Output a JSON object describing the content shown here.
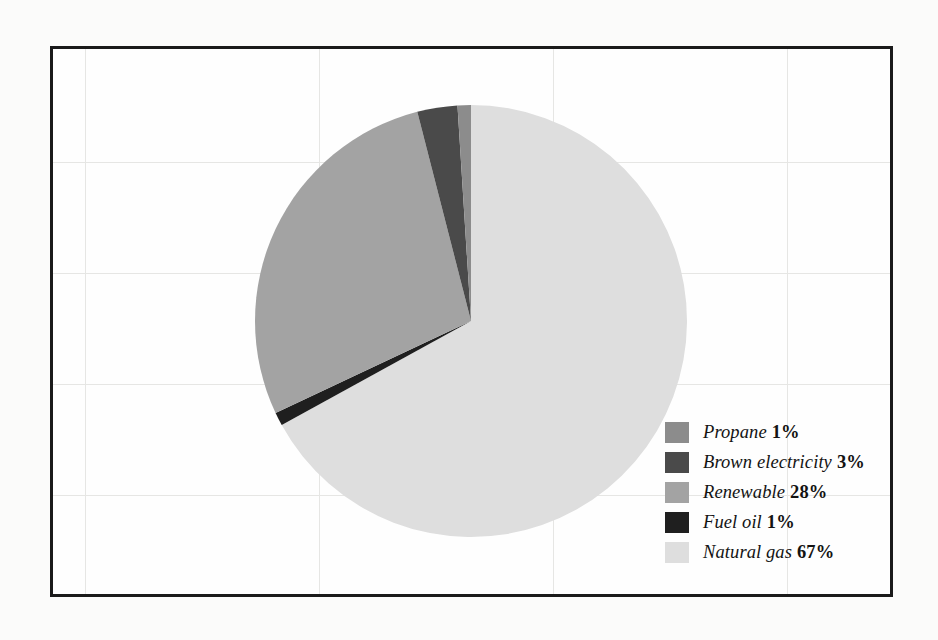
{
  "figure": {
    "background_color": "#fbfbfa",
    "frame_color": "#1a1a1a",
    "grid_color": "#e6e6e4"
  },
  "chart_data": {
    "type": "pie",
    "title": "",
    "subtitle": "",
    "xlabel": "",
    "ylabel": "",
    "grid": true,
    "legend_position": "lower-right",
    "unit": "%",
    "start_angle_deg": 0,
    "direction": "clockwise",
    "categories": [
      "Natural gas",
      "Fuel oil",
      "Renewable",
      "Brown electricity",
      "Propane"
    ],
    "values": [
      67,
      1,
      28,
      3,
      1
    ],
    "colors": [
      "#dedede",
      "#1f1f1f",
      "#a3a3a3",
      "#4a4a4a",
      "#8c8c8c"
    ],
    "series": [
      {
        "name": "Energy mix",
        "values": [
          67,
          1,
          28,
          3,
          1
        ]
      }
    ],
    "slices": [
      {
        "label": "Natural gas",
        "value": 67,
        "display": "67%",
        "color": "#dedede"
      },
      {
        "label": "Fuel oil",
        "value": 1,
        "display": "1%",
        "color": "#1f1f1f"
      },
      {
        "label": "Renewable",
        "value": 28,
        "display": "28%",
        "color": "#a3a3a3"
      },
      {
        "label": "Brown electricity",
        "value": 3,
        "display": "3%",
        "color": "#4a4a4a"
      },
      {
        "label": "Propane",
        "value": 1,
        "display": "1%",
        "color": "#8c8c8c"
      }
    ]
  },
  "legend": {
    "entries": [
      {
        "label": "Propane",
        "percent": "1%",
        "color": "#8c8c8c"
      },
      {
        "label": "Brown electricity",
        "percent": "3%",
        "color": "#4a4a4a"
      },
      {
        "label": "Renewable",
        "percent": "28%",
        "color": "#a3a3a3"
      },
      {
        "label": "Fuel oil",
        "percent": "1%",
        "color": "#1f1f1f"
      },
      {
        "label": "Natural gas",
        "percent": "67%",
        "color": "#dedede"
      }
    ]
  }
}
